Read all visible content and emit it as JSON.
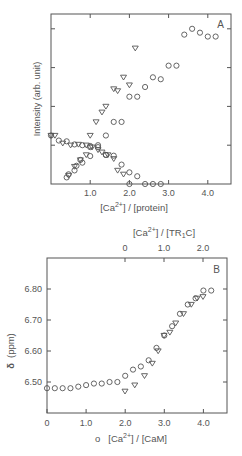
{
  "chart_data": [
    {
      "type": "scatter",
      "panel_label": "A",
      "title": "",
      "xlabel": "[Ca2+]/[protein]",
      "ylabel": "Intensity (arb. unit)",
      "xlim": [
        0,
        4.6
      ],
      "ylim": [
        0,
        4.4
      ],
      "x_ticks": [
        1.0,
        2.0,
        3.0,
        4.0
      ],
      "x_tick_labels": [
        "1.0",
        "2.0",
        "3.0",
        "4.0"
      ],
      "y_ticks": [
        1,
        2,
        3,
        4
      ],
      "y_tick_labels": [
        "",
        "",
        "",
        ""
      ],
      "grid": false,
      "series": [
        {
          "name": "circles rising",
          "marker": "circle",
          "x": [
            0.4,
            0.45,
            0.6,
            0.65,
            0.75,
            0.8,
            1.0,
            1.0,
            1.2,
            1.4,
            1.4,
            1.6,
            1.8,
            2.0,
            2.2,
            2.4,
            2.6,
            2.8,
            3.0,
            3.2,
            3.4,
            3.6,
            3.8,
            4.0,
            4.2
          ],
          "y": [
            0.17,
            0.25,
            0.35,
            0.47,
            0.62,
            0.55,
            0.72,
            0.95,
            1.0,
            1.25,
            0.75,
            1.6,
            1.6,
            2.25,
            2.25,
            2.5,
            2.75,
            2.7,
            3.05,
            3.05,
            3.85,
            4.0,
            3.9,
            3.8,
            3.8
          ]
        },
        {
          "name": "triangles rising",
          "marker": "triangle-down",
          "x": [
            0.45,
            0.6,
            0.75,
            0.9,
            1.0,
            1.15,
            1.3,
            1.4,
            1.6,
            1.7,
            1.85,
            2.0,
            2.15
          ],
          "y": [
            0.22,
            0.45,
            0.62,
            0.75,
            1.25,
            1.6,
            1.85,
            2.0,
            2.45,
            2.4,
            2.75,
            2.55,
            3.5
          ]
        },
        {
          "name": "circles falling",
          "marker": "circle",
          "x": [
            0.0,
            0.2,
            0.4,
            0.6,
            0.8,
            1.0,
            1.2,
            1.4,
            1.6,
            1.8,
            2.0,
            2.2,
            2.4,
            2.6,
            2.8,
            2.0
          ],
          "y": [
            1.25,
            1.12,
            1.1,
            1.02,
            1.0,
            0.98,
            0.95,
            0.75,
            0.73,
            0.5,
            0.3,
            0.2,
            0.0,
            0.0,
            0.0,
            0.0
          ]
        },
        {
          "name": "triangles falling",
          "marker": "triangle-down",
          "x": [
            0.0,
            0.1,
            0.3,
            0.5,
            0.7,
            0.9,
            1.05,
            1.2,
            1.3,
            1.45,
            1.6,
            1.7,
            1.85
          ],
          "y": [
            1.25,
            1.25,
            1.05,
            1.0,
            1.02,
            1.0,
            0.95,
            0.88,
            0.82,
            0.75,
            0.65,
            0.35,
            0.25
          ]
        }
      ]
    },
    {
      "type": "scatter",
      "panel_label": "B",
      "title": "",
      "xlabel": "[Ca2+]/[CaM]",
      "xlabel_marker": "circle",
      "x2label": "[Ca2+]/[TR1C]",
      "ylabel": "δ (ppm)",
      "xlim": [
        0,
        4.6
      ],
      "ylim": [
        6.4,
        6.9
      ],
      "x_ticks": [
        0,
        1.0,
        2.0,
        3.0,
        4.0
      ],
      "x_tick_labels": [
        "0",
        "1.0",
        "2.0",
        "3.0",
        "4.0"
      ],
      "x2_ticks": [
        0,
        1.0,
        2.0
      ],
      "x2_tick_labels": [
        "0",
        "1.0",
        "2.0"
      ],
      "y_ticks": [
        6.5,
        6.6,
        6.7,
        6.8
      ],
      "y_tick_labels": [
        "6.50",
        "6.60",
        "6.70",
        "6.80"
      ],
      "grid": false,
      "series": [
        {
          "name": "CaM (circles, bottom axis)",
          "marker": "circle",
          "x": [
            0,
            0.2,
            0.4,
            0.6,
            0.8,
            1.0,
            1.2,
            1.4,
            1.6,
            1.8,
            2.0,
            2.2,
            2.4,
            2.6,
            2.8,
            3.0,
            3.2,
            3.4,
            3.6,
            3.8,
            4.0,
            4.2
          ],
          "y": [
            6.48,
            6.48,
            6.48,
            6.48,
            6.485,
            6.49,
            6.495,
            6.495,
            6.5,
            6.5,
            6.52,
            6.54,
            6.55,
            6.57,
            6.61,
            6.65,
            6.68,
            6.72,
            6.75,
            6.77,
            6.795,
            6.795
          ]
        },
        {
          "name": "TR1C (triangles, top axis)",
          "marker": "triangle-down",
          "x2": [
            0.0,
            0.25,
            0.5,
            0.7,
            0.85,
            1.0,
            1.15,
            1.3,
            1.5,
            1.7,
            1.85,
            2.0
          ],
          "y": [
            6.47,
            6.49,
            6.52,
            6.56,
            6.6,
            6.65,
            6.66,
            6.69,
            6.72,
            6.75,
            6.77,
            6.775
          ]
        }
      ]
    }
  ],
  "panelA": {
    "label": "A",
    "ylabel": "Intensity  (arb. unit)",
    "xlabel_pre": "[Ca",
    "xlabel_sup": "2+",
    "xlabel_post": "] / [protein]",
    "xticks": [
      "1.0",
      "2.0",
      "3.0",
      "4.0"
    ]
  },
  "panelB": {
    "label": "B",
    "ylabel_symbol": "δ",
    "ylabel_unit": "(ppm)",
    "yticks": [
      "6.80",
      "6.70",
      "6.60",
      "6.50"
    ],
    "xticks": [
      "0",
      "1.0",
      "2.0",
      "3.0",
      "4.0"
    ],
    "top_xticks": [
      "0",
      "1.0",
      "2.0"
    ],
    "xlabel_marker": "o",
    "xlabel_pre": "[Ca",
    "xlabel_sup": "2+",
    "xlabel_post": "] / [CaM]",
    "top_label_pre": "[Ca",
    "top_label_sup": "2+",
    "top_label_mid": "] / [TR",
    "top_label_sub": "1",
    "top_label_post": "C]"
  }
}
